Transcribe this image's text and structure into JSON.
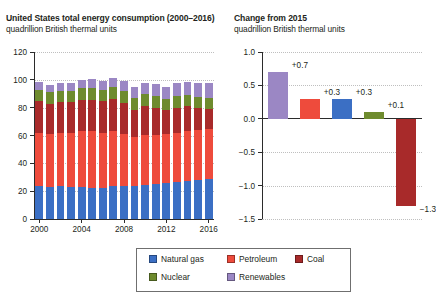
{
  "left": {
    "title": "United States total energy consumption (2000–2016)",
    "subtitle": "quadrillion British thermal units"
  },
  "right": {
    "title": "Change from 2015",
    "subtitle": "quadrillion British thermal units"
  },
  "legend": {
    "items": [
      {
        "label": "Natural gas",
        "color": "#3b6fc4"
      },
      {
        "label": "Petroleum",
        "color": "#ee4b3c"
      },
      {
        "label": "Coal",
        "color": "#a82a2a"
      },
      {
        "label": "Nuclear",
        "color": "#6e8b2e"
      },
      {
        "label": "Renewables",
        "color": "#9b87c4"
      }
    ]
  },
  "chart_data": [
    {
      "type": "bar",
      "id": "us-total-energy-consumption",
      "title": "United States total energy consumption (2000–2016)",
      "subtitle": "quadrillion British thermal units",
      "xlabel": "",
      "ylabel": "quadrillion British thermal units",
      "stacked": true,
      "grid": true,
      "legend_position": "bottom",
      "ylim": [
        0,
        120
      ],
      "yticks": [
        0,
        20,
        40,
        60,
        80,
        100,
        120
      ],
      "ytick_labels": [
        "0",
        "20",
        "40",
        "60",
        "80",
        "100",
        "120"
      ],
      "categories": [
        2000,
        2001,
        2002,
        2003,
        2004,
        2005,
        2006,
        2007,
        2008,
        2009,
        2010,
        2011,
        2012,
        2013,
        2014,
        2015,
        2016
      ],
      "xtick_labels": [
        "2000",
        "2004",
        "2008",
        "2012",
        "2016"
      ],
      "xticks": [
        2000,
        2004,
        2008,
        2012,
        2016
      ],
      "series": [
        {
          "name": "Natural gas",
          "color": "#3b6fc4",
          "values": [
            23.8,
            22.8,
            23.6,
            22.8,
            22.9,
            22.6,
            22.2,
            23.7,
            23.8,
            23.4,
            24.6,
            24.9,
            26.1,
            26.8,
            27.5,
            28.2,
            28.4
          ]
        },
        {
          "name": "Petroleum",
          "color": "#ee4b3c",
          "values": [
            38.3,
            38.2,
            38.4,
            38.8,
            40.3,
            40.4,
            39.9,
            39.8,
            37.3,
            35.4,
            36.0,
            35.3,
            34.7,
            35.1,
            35.4,
            36.0,
            36.2
          ]
        },
        {
          "name": "Coal",
          "color": "#a82a2a",
          "values": [
            22.6,
            21.9,
            21.9,
            22.3,
            22.5,
            22.8,
            22.4,
            22.7,
            22.4,
            19.7,
            20.8,
            19.6,
            17.3,
            18.0,
            18.0,
            15.5,
            14.2
          ]
        },
        {
          "name": "Nuclear",
          "color": "#6e8b2e",
          "values": [
            7.9,
            8.0,
            8.1,
            7.9,
            8.2,
            8.2,
            8.2,
            8.4,
            8.4,
            8.4,
            8.4,
            8.3,
            8.1,
            8.2,
            8.3,
            8.3,
            8.4
          ]
        },
        {
          "name": "Renewables",
          "color": "#9b87c4",
          "values": [
            6.2,
            5.3,
            5.8,
            6.1,
            6.2,
            6.4,
            6.8,
            6.7,
            7.2,
            7.6,
            8.1,
            9.2,
            8.7,
            9.3,
            9.6,
            9.5,
            10.2
          ]
        }
      ],
      "totals": [
        98.8,
        96.2,
        97.8,
        97.9,
        100.1,
        100.4,
        99.5,
        101.3,
        99.1,
        94.5,
        97.9,
        97.3,
        94.9,
        97.4,
        98.8,
        97.5,
        97.4
      ]
    },
    {
      "type": "bar",
      "id": "change-from-2015",
      "title": "Change from 2015",
      "subtitle": "quadrillion British thermal units",
      "xlabel": "",
      "ylabel": "quadrillion British thermal units",
      "stacked": false,
      "grid": true,
      "ylim": [
        -1.5,
        1.0
      ],
      "yticks": [
        1.0,
        0.5,
        0.0,
        -0.5,
        -1.0,
        -1.5
      ],
      "ytick_labels": [
        "1.0",
        "0.5",
        "0.0",
        "−0.5",
        "−1.0",
        "−1.5"
      ],
      "categories": [
        "Renewables",
        "Petroleum",
        "Natural gas",
        "Nuclear",
        "Coal"
      ],
      "values": [
        0.7,
        0.3,
        0.3,
        0.1,
        -1.3
      ],
      "value_labels": [
        "+0.7",
        "+0.3",
        "+0.3",
        "+0.1",
        "−1.3"
      ],
      "colors": [
        "#9b87c4",
        "#ee4b3c",
        "#3b6fc4",
        "#6e8b2e",
        "#a82a2a"
      ]
    }
  ]
}
